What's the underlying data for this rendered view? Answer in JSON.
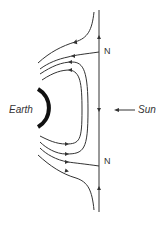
{
  "labels": {
    "earth": "Earth",
    "sun": "Sun",
    "neutral_top": "N",
    "neutral_bottom": "N"
  },
  "colors": {
    "line": "#333333",
    "earth": "#111111"
  }
}
